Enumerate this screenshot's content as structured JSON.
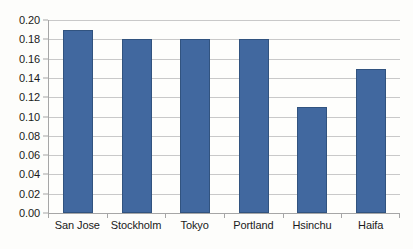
{
  "chart_data": {
    "type": "bar",
    "title": "",
    "subtitle": "",
    "xlabel": "",
    "ylabel": "",
    "categories": [
      "San Jose",
      "Stockholm",
      "Tokyo",
      "Portland",
      "Hsinchu",
      "Haifa"
    ],
    "values": [
      0.19,
      0.18,
      0.18,
      0.18,
      0.11,
      0.149
    ],
    "series": [
      {
        "name": "",
        "values": [
          0.19,
          0.18,
          0.18,
          0.18,
          0.11,
          0.149
        ],
        "color": "#41689f"
      }
    ],
    "ylim": [
      0.0,
      0.2
    ],
    "ytick_step": 0.02,
    "ytick_labels": [
      "0.20",
      "0.18",
      "0.16",
      "0.14",
      "0.12",
      "0.10",
      "0.08",
      "0.06",
      "0.04",
      "0.02",
      "0.00"
    ],
    "ytick_values": [
      0.2,
      0.18,
      0.16,
      0.14,
      0.12,
      0.1,
      0.08,
      0.06,
      0.04,
      0.02,
      0.0
    ],
    "grid": true,
    "grid_axis": "y",
    "legend": false,
    "legend_position": "none",
    "annotations": []
  },
  "style": {
    "bar_fill": "#41689f",
    "bar_stroke": "#31537f",
    "gridline_color": "#c9c9c9",
    "axis_color": "#a6a6a6",
    "text_color": "#1a1a1a",
    "plot_background": "#fefefc",
    "figure_background": "#fdfdfb"
  }
}
